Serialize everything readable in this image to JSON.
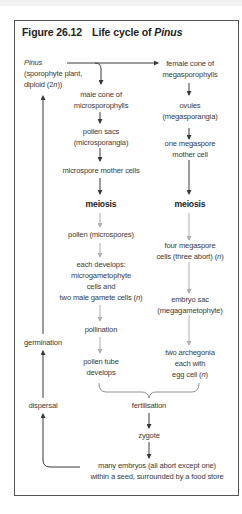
{
  "figure": {
    "label": "Figure 26.12",
    "title_prefix": "Life cycle of ",
    "title_italic": "Pinus"
  },
  "nodes": {
    "pinus_name": "Pinus",
    "pinus_line2": "(sporophyte plant,",
    "pinus_line3_pre": "diploid (2",
    "pinus_line3_n": "n",
    "pinus_line3_post": "))",
    "male_cone_1": "male cone of",
    "male_cone_2": "microsporophylls",
    "pollen_sacs_1": "pollen sacs",
    "pollen_sacs_2": "(microsporangia)",
    "microspore_mother": "microspore mother cells",
    "meiosis_left": "meiosis",
    "pollen": "pollen (microspores)",
    "each_dev_1": "each develops:",
    "each_dev_2": "microgametophyte",
    "each_dev_3": "cells and",
    "each_dev_4_pre": "two male gamete cells (",
    "each_dev_4_n": "n",
    "each_dev_4_post": ")",
    "pollination": "pollination",
    "pollen_tube_1": "pollen tube",
    "pollen_tube_2": "develops",
    "female_cone_1": "female cone of",
    "female_cone_2": "megasporophylls",
    "ovules_1": "ovules",
    "ovules_2": "(megasporangia)",
    "megaspore_mother_1": "one megaspore",
    "megaspore_mother_2": "mother cell",
    "meiosis_right": "meiosis",
    "four_mega_1": "four megaspore",
    "four_mega_2_pre": "cells (three abort) (",
    "four_mega_2_n": "n",
    "four_mega_2_post": ")",
    "embryo_sac_1": "embryo sac",
    "embryo_sac_2": "(megagametophyte)",
    "archegonia_1": "two archegonia",
    "archegonia_2": "each with",
    "archegonia_3_pre": "egg cell (",
    "archegonia_3_n": "n",
    "archegonia_3_post": ")",
    "fertilisation": "fertilisation",
    "zygote": "zygote",
    "embryos_1": "many embryos (all abort except one)",
    "embryos_2": "within a seed, surrounded by a food store",
    "germination": "germination",
    "dispersal": "dispersal"
  },
  "colors": {
    "diploid_arrow": "#3a3a3a",
    "haploid_arrow": "#b0b0b0",
    "frame": "#555555"
  }
}
